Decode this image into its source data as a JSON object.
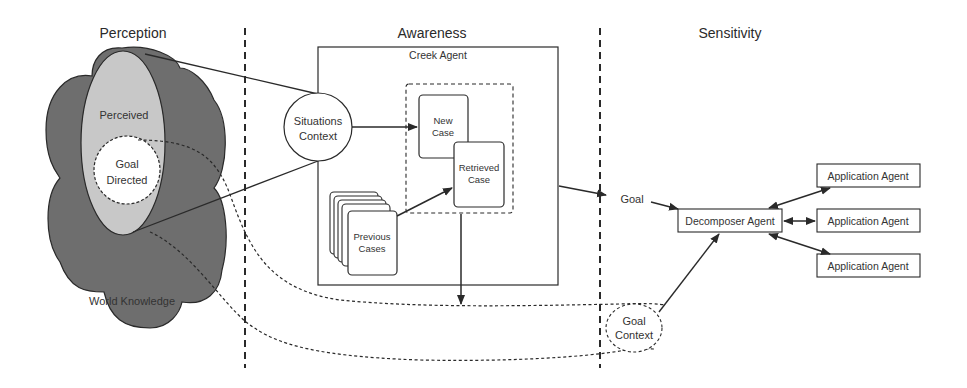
{
  "sections": {
    "perception": "Perception",
    "awareness": "Awareness",
    "sensitivity": "Sensitivity"
  },
  "perception": {
    "perceived": "Perceived",
    "goal_directed_line1": "Goal",
    "goal_directed_line2": "Directed",
    "world_knowledge": "World Knowledge"
  },
  "awareness": {
    "creek_agent": "Creek Agent",
    "situations_context_line1": "Situations",
    "situations_context_line2": "Context",
    "new_case_line1": "New",
    "new_case_line2": "Case",
    "retrieved_case_line1": "Retrieved",
    "retrieved_case_line2": "Case",
    "previous_cases_line1": "Previous",
    "previous_cases_line2": "Cases"
  },
  "sensitivity": {
    "goal": "Goal",
    "goal_context_line1": "Goal",
    "goal_context_line2": "Context",
    "decomposer_agent": "Decomposer Agent",
    "application_agents": [
      "Application Agent",
      "Application Agent",
      "Application Agent"
    ]
  },
  "colors": {
    "cloud_dark": "#6e6e6e",
    "perceived_fill": "#c8c8c8",
    "goal_directed_fill": "#ffffff",
    "stroke": "#2a2a2a"
  }
}
